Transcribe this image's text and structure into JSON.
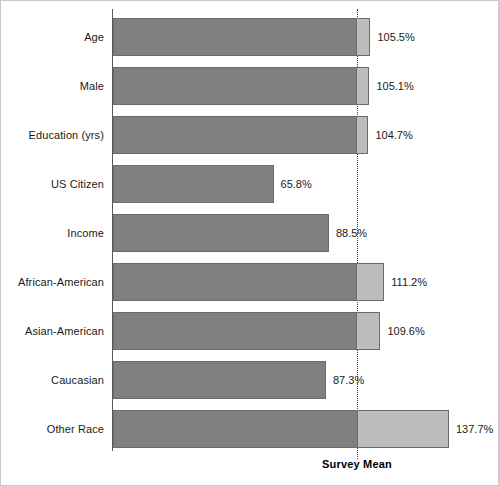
{
  "chart_data": {
    "type": "bar",
    "orientation": "horizontal",
    "title": "",
    "xlabel": "",
    "ylabel": "",
    "categories": [
      "Age",
      "Male",
      "Education (yrs)",
      "US Citizen",
      "Income",
      "African-American",
      "Asian-American",
      "Caucasian",
      "Other Race"
    ],
    "values": [
      105.5,
      105.1,
      104.7,
      65.8,
      88.5,
      111.2,
      109.6,
      87.3,
      137.7
    ],
    "value_labels": [
      "105.5%",
      "105.1%",
      "104.7%",
      "65.8%",
      "88.5%",
      "111.2%",
      "109.6%",
      "87.3%",
      "137.7%"
    ],
    "xlim": [
      0,
      154
    ],
    "grid": false,
    "legend": false,
    "reference_line": {
      "value": 100,
      "label": "Survey Mean",
      "style": "dotted"
    },
    "colors": {
      "bar_below_mean": "#808080",
      "bar_above_mean": "#bdbdbd",
      "bar_border": "#6b6b6b",
      "axis": "#5a5a5a",
      "reference_line": "#3c3c3c",
      "text": "#1a1a1a",
      "background": "#ffffff"
    }
  }
}
